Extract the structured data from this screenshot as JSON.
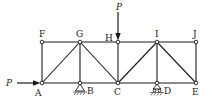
{
  "diagram": {
    "type": "truss",
    "joints": {
      "F": {
        "label": "F",
        "x": 42,
        "y": 42
      },
      "G": {
        "label": "G",
        "x": 80,
        "y": 42
      },
      "H": {
        "label": "H",
        "x": 118,
        "y": 42
      },
      "I": {
        "label": "I",
        "x": 157,
        "y": 42
      },
      "J": {
        "label": "J",
        "x": 196,
        "y": 42
      },
      "A": {
        "label": "A",
        "x": 42,
        "y": 83
      },
      "B": {
        "label": "B",
        "x": 80,
        "y": 83
      },
      "C": {
        "label": "C",
        "x": 118,
        "y": 83
      },
      "D": {
        "label": "D",
        "x": 157,
        "y": 83
      },
      "E": {
        "label": "E",
        "x": 196,
        "y": 83
      }
    },
    "members": [
      [
        "F",
        "G"
      ],
      [
        "G",
        "H"
      ],
      [
        "H",
        "I"
      ],
      [
        "I",
        "J"
      ],
      [
        "A",
        "B"
      ],
      [
        "B",
        "C"
      ],
      [
        "C",
        "D"
      ],
      [
        "D",
        "E"
      ],
      [
        "F",
        "A"
      ],
      [
        "G",
        "B"
      ],
      [
        "H",
        "C"
      ],
      [
        "I",
        "D"
      ],
      [
        "J",
        "E"
      ],
      [
        "A",
        "G"
      ],
      [
        "G",
        "C"
      ],
      [
        "C",
        "I"
      ],
      [
        "I",
        "E"
      ]
    ],
    "supports": {
      "B": {
        "type": "pin"
      },
      "D": {
        "type": "roller"
      }
    },
    "loads": [
      {
        "label": "P",
        "at": "A",
        "direction": "right"
      },
      {
        "label": "P",
        "at": "H",
        "direction": "down"
      }
    ]
  }
}
